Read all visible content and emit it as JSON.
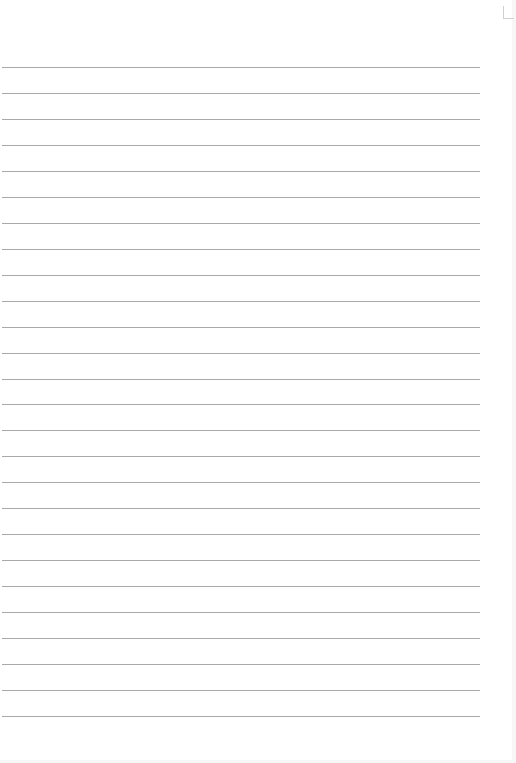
{
  "sheet": {
    "type": "lined-paper",
    "line_count": 26,
    "first_line_y": 67,
    "line_spacing": 25.96,
    "line_color": "#a9a9a9",
    "background_color": "#ffffff"
  }
}
